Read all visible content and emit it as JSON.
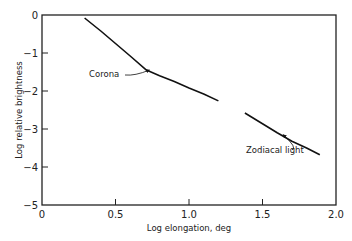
{
  "chart_data": {
    "type": "line",
    "title": "",
    "xlabel": "Log elongation, deg",
    "ylabel": "Log relative brightness",
    "xlim": [
      0,
      2.0
    ],
    "ylim": [
      -5,
      0
    ],
    "xticks": [
      0,
      0.5,
      1.0,
      1.5,
      2.0
    ],
    "xtick_labels": [
      "0",
      "0.5",
      "1.0",
      "1.5",
      "2.0"
    ],
    "yticks": [
      0,
      -1,
      -2,
      -3,
      -4,
      -5
    ],
    "ytick_labels": [
      "0",
      "−1",
      "−2",
      "−3",
      "−4",
      "−5"
    ],
    "grid": false,
    "legend": "none",
    "series": [
      {
        "name": "Corona",
        "x": [
          0.29,
          0.4,
          0.5,
          0.6,
          0.71,
          0.8,
          0.9,
          1.0,
          1.1,
          1.2
        ],
        "y": [
          -0.08,
          -0.42,
          -0.75,
          -1.08,
          -1.45,
          -1.6,
          -1.75,
          -1.92,
          -2.08,
          -2.26
        ]
      },
      {
        "name": "Zodiacal light",
        "x": [
          1.38,
          1.5,
          1.6,
          1.7,
          1.8,
          1.89
        ],
        "y": [
          -2.58,
          -2.86,
          -3.1,
          -3.32,
          -3.5,
          -3.68
        ]
      }
    ],
    "annotations": [
      {
        "text": "Corona",
        "points_to": {
          "x": 0.73,
          "y": -1.45
        }
      },
      {
        "text": "Zodiacal light",
        "points_to": {
          "x": 1.64,
          "y": -3.15
        }
      }
    ]
  }
}
